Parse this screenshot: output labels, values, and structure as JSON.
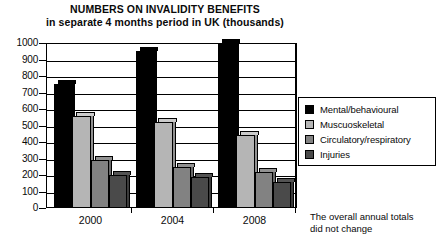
{
  "chart_data": {
    "type": "bar",
    "title": "NUMBERS ON INVALIDITY BENEFITS",
    "subtitle": "in separate 4 months period in UK (thousands)",
    "xlabel": "",
    "ylabel": "",
    "categories": [
      "2000",
      "2004",
      "2008"
    ],
    "series": [
      {
        "name": "Mental/behavioural",
        "values": [
          750,
          950,
          1000
        ],
        "color": "#000000"
      },
      {
        "name": "Muscuoskeletal",
        "values": [
          560,
          520,
          440
        ],
        "color": "#b5b5b5"
      },
      {
        "name": "Circulatory/respiratory",
        "values": [
          290,
          250,
          220
        ],
        "color": "#828282"
      },
      {
        "name": "Injuries",
        "values": [
          200,
          190,
          160
        ],
        "color": "#4a4a4a"
      }
    ],
    "ylim": [
      0,
      1000
    ],
    "ytick_values": [
      "0",
      "100",
      "200",
      "300",
      "400",
      "500",
      "600",
      "700",
      "800",
      "900",
      "1000"
    ],
    "grid": true,
    "legend_position": "right"
  },
  "legend": {
    "items": [
      {
        "label": "Mental/behavioural"
      },
      {
        "label": "Muscuoskeletal"
      },
      {
        "label": "Circulatory/respiratory"
      },
      {
        "label": "Injuries"
      }
    ]
  },
  "footnote": {
    "line1": "The overall annual totals",
    "line2": "did not change"
  }
}
